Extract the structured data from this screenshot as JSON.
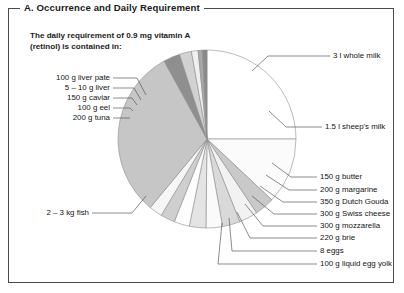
{
  "panel": {
    "title": "A. Occurrence and Daily Requirement",
    "intro": "The daily requirement of 0.9 mg vitamin A\n(retinol) is contained in:"
  },
  "chart_data": {
    "type": "pie",
    "title": "A. Occurrence and Daily Requirement",
    "subtitle": "The daily requirement of 0.9 mg vitamin A (retinol) is contained in:",
    "legend_position": "callout-labels",
    "grid": false,
    "note": "Each slice area represents the relative amount of food needed to supply 0.9 mg vitamin A; slice sizes given as percent of the full circle.",
    "categories": [
      "3 l whole milk",
      "1.5 l sheep's milk",
      "150 g butter",
      "200 g margarine",
      "350 g Dutch Gouda",
      "300 g Swiss cheese",
      "300 g mozzarella",
      "220 g brie",
      "8 eggs",
      "100 g liquid egg yolk",
      "2 – 3 kg fish",
      "200 g tuna",
      "100 g eel",
      "150 g caviar",
      "5 – 10 g liver",
      "100 g liver pate"
    ],
    "values": [
      25.0,
      12.0,
      3.6,
      3.4,
      3.2,
      3.0,
      3.0,
      2.8,
      2.6,
      2.4,
      31.0,
      3.0,
      2.2,
      1.2,
      0.8,
      0.8
    ],
    "colors": [
      "#ffffff",
      "#fbfbfb",
      "#c9c9c9",
      "#f2f2f2",
      "#d9d9d9",
      "#fafafa",
      "#e4e4e4",
      "#fdfdfd",
      "#cfcfcf",
      "#f6f6f6",
      "#c6c6c6",
      "#8f8f8f",
      "#d2d2d2",
      "#f0f0f0",
      "#a8a8a8",
      "#8a8a8a"
    ],
    "start_angle_deg": -90,
    "direction": "clockwise"
  },
  "labels": {
    "right_top": [
      {
        "text": "3 l whole milk"
      },
      {
        "text": "1.5 l sheep's milk"
      }
    ],
    "right_bottom": [
      {
        "text": "150 g butter"
      },
      {
        "text": "200 g margarine"
      },
      {
        "text": "350 g Dutch Gouda"
      },
      {
        "text": "300 g Swiss cheese"
      },
      {
        "text": "300 g mozzarella"
      },
      {
        "text": "220 g brie"
      },
      {
        "text": "8 eggs"
      },
      {
        "text": "100 g liquid egg yolk"
      }
    ],
    "left_top": [
      {
        "text": "100 g liver pate"
      },
      {
        "text": "5 – 10 g liver"
      },
      {
        "text": "150 g caviar"
      },
      {
        "text": "100 g eel"
      },
      {
        "text": "200 g tuna"
      }
    ],
    "left_bottom": [
      {
        "text": "2 – 3 kg fish"
      }
    ]
  },
  "style": {
    "border_color": "#4a4a4a",
    "text_color": "#141414",
    "leader_color": "#5a5a5a",
    "slice_stroke": "#8d8d8d"
  }
}
